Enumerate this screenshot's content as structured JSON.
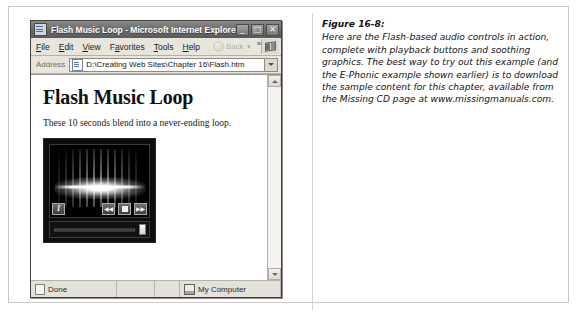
{
  "window": {
    "title": "Flash Music Loop - Microsoft Internet Explorer",
    "title_icon": "page-icon",
    "buttons": {
      "minimize": "_",
      "maximize": "□",
      "close": "✕"
    }
  },
  "menubar": {
    "items": [
      {
        "label": "File",
        "accel": "F"
      },
      {
        "label": "Edit",
        "accel": "E"
      },
      {
        "label": "View",
        "accel": "V"
      },
      {
        "label": "Favorites",
        "accel": "a"
      },
      {
        "label": "Tools",
        "accel": "T"
      },
      {
        "label": "Help",
        "accel": "H"
      }
    ],
    "back_button": "Back",
    "back_caret": "▾",
    "overflow_chevron": "»",
    "brand_icon": "windows-flag-icon"
  },
  "addressbar": {
    "label": "Address",
    "value": "D:\\Creating Web Sites\\Chapter 16\\Flash.htm",
    "icon": "page-icon",
    "dropdown": "▾"
  },
  "page": {
    "heading": "Flash Music Loop",
    "paragraph": "These 10 seconds blend into a never-ending loop.",
    "flash": {
      "visualization": "audio-starburst-waveform",
      "info_button": "I",
      "rewind_button": "◀◀",
      "stop_button": "■",
      "forward_button": "▶▶",
      "slider_position": "100%"
    }
  },
  "scrollbar": {
    "up_arrow": "▲",
    "down_arrow": "▼"
  },
  "statusbar": {
    "status": "Done",
    "zone": "My Computer"
  },
  "caption": {
    "label": "Figure 16-8:",
    "body": "Here are the Flash-based audio controls in action, complete with playback buttons and soothing graphics. The best way to try out this example (and the E-Phonic example shown earlier) is to download the sample content for this chapter, available from the Missing CD page at www.missingmanuals.com."
  },
  "colors": {
    "titlebar": "#6e6e6e",
    "chrome": "#e8e5dd",
    "page_bg": "#ffffff",
    "flash_bg": "#0d0d0d",
    "frame_border": "#c9c9c9"
  }
}
